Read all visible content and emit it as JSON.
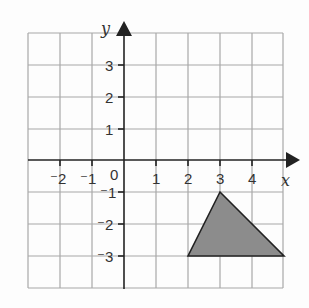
{
  "diagram": {
    "type": "coordinate-grid",
    "x_axis_label": "x",
    "y_axis_label": "y",
    "x_range": [
      -3,
      5
    ],
    "y_range": [
      -4,
      4
    ],
    "x_tick_labels": [
      "⁻2",
      "⁻1",
      "0",
      "1",
      "2",
      "3",
      "4"
    ],
    "y_tick_labels": [
      "3",
      "2",
      "1",
      "⁻1",
      "⁻2",
      "⁻3"
    ],
    "shape": {
      "name": "triangle",
      "vertices": [
        [
          3,
          -1
        ],
        [
          2,
          -3
        ],
        [
          5,
          -3
        ]
      ],
      "fill": "#8c8c8c",
      "stroke": "#222222"
    },
    "colors": {
      "grid": "#a8a8a8",
      "axis": "#222222",
      "background": "#fdfdfd"
    }
  }
}
